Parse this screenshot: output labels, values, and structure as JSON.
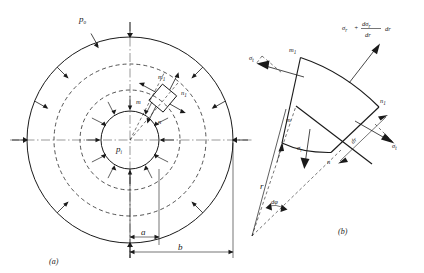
{
  "page": {
    "header_fragment": "",
    "background_color": "#ffffff",
    "ink_color": "#1a1a1a"
  },
  "figure": {
    "subfigures": [
      {
        "caption": "(a)",
        "title": "Thick-walled cylinder cross section",
        "labels": {
          "outer_pressure": "p",
          "outer_pressure_sub": "o",
          "inner_pressure": "p",
          "inner_pressure_sub": "i",
          "element_corner_inner_left": "m",
          "element_corner_inner_right": "n",
          "element_corner_outer_left": "m",
          "element_corner_outer_left_sub": "1",
          "element_corner_outer_right": "n",
          "element_corner_outer_right_sub": "1",
          "dim_inner_radius": "a",
          "dim_outer_radius": "b"
        },
        "geometry": {
          "center_x": 130,
          "center_y": 140,
          "inner_radius_a": 29,
          "outer_radius_b": 103,
          "element_inner_radius": 50,
          "element_outer_radius": 76
        }
      },
      {
        "caption": "(b)",
        "title": "Enlarged stress element free body",
        "labels": {
          "corner_inner_left": "m",
          "corner_inner_right": "n",
          "corner_outer_left": "m",
          "corner_outer_left_sub": "1",
          "corner_outer_right": "n",
          "corner_outer_right_sub": "1",
          "radial_stress": "σ",
          "radial_stress_sub": "r",
          "tangential_stress": "σ",
          "tangential_stress_sub": "t",
          "radial_increment_formula": "σ",
          "radial_increment_sub": "r",
          "radial_increment_plus": "+",
          "radial_increment_num": "dσ",
          "radial_increment_num_sub": "r",
          "radial_increment_den": "dr",
          "radial_increment_tail": "dr",
          "thickness_increment": "dr",
          "angle_increment": "dφ",
          "radius": "r"
        }
      }
    ]
  }
}
